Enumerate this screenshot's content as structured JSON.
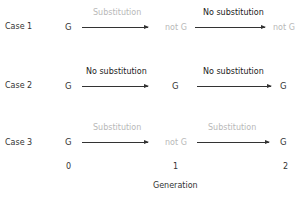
{
  "diagram": {
    "cases": [
      {
        "label": "Case 1",
        "nodes": [
          "G",
          "not G",
          "not G"
        ],
        "node_faded": [
          false,
          true,
          true
        ],
        "edges": [
          {
            "label": "Substitution",
            "faded": true
          },
          {
            "label": "No substitution",
            "faded": false
          }
        ]
      },
      {
        "label": "Case 2",
        "nodes": [
          "G",
          "G",
          "G"
        ],
        "node_faded": [
          false,
          false,
          false
        ],
        "edges": [
          {
            "label": "No substitution",
            "faded": false
          },
          {
            "label": "No substitution",
            "faded": false
          }
        ]
      },
      {
        "label": "Case 3",
        "nodes": [
          "G",
          "not G",
          "G"
        ],
        "node_faded": [
          false,
          true,
          false
        ],
        "edges": [
          {
            "label": "Substitution",
            "faded": true
          },
          {
            "label": "Substitution",
            "faded": true
          }
        ]
      }
    ],
    "axis": {
      "ticks": [
        "0",
        "1",
        "2"
      ],
      "title": "Generation"
    },
    "colors": {
      "text": "#333333",
      "faded": "#b8b8b8",
      "arrow": "#333333"
    }
  }
}
